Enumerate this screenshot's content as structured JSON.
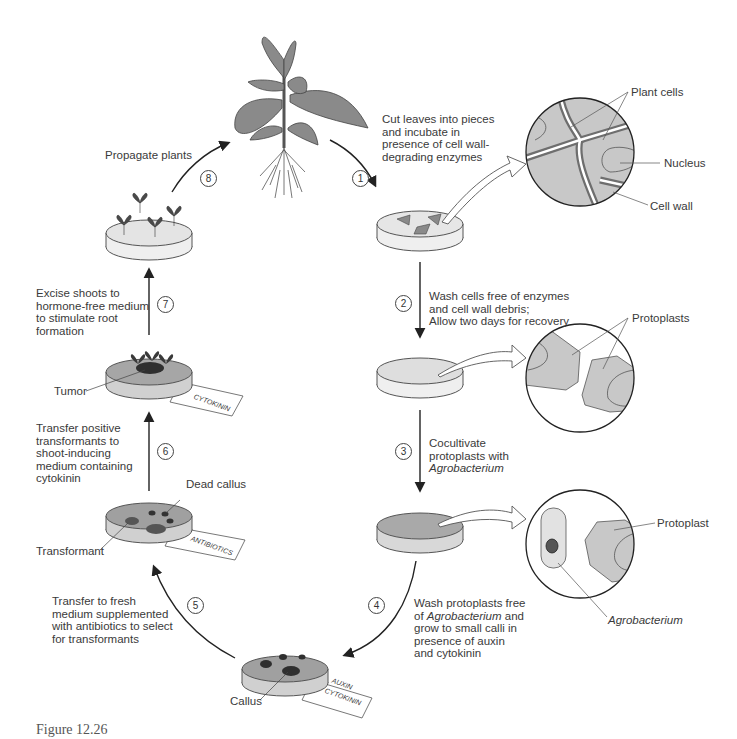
{
  "figure": {
    "caption": "Figure 12.26"
  },
  "steps": [
    {
      "number": "1",
      "text": "Cut leaves into pieces\nand incubate in\npresence of cell wall-\ndegrading enzymes"
    },
    {
      "number": "2",
      "text": "Wash cells free of enzymes\nand cell wall debris;\nAllow two days for recovery"
    },
    {
      "number": "3",
      "line1": "Cocultivate",
      "line2": "protoplasts with",
      "line3_italic": "Agrobacterium"
    },
    {
      "number": "4",
      "line1": "Wash protoplasts free",
      "line2_pre": "of ",
      "line2_italic": "Agrobacterium",
      "line2_post": " and",
      "line3": "grow to small calli in",
      "line4": "presence of auxin",
      "line5": "and cytokinin"
    },
    {
      "number": "5",
      "text": "Transfer to fresh\nmedium supplemented\nwith antibiotics to select\nfor transformants"
    },
    {
      "number": "6",
      "text": "Transfer positive\ntransformants to\nshoot-inducing\nmedium containing\ncytokinin"
    },
    {
      "number": "7",
      "text": "Excise shoots to\nhormone-free medium\nto stimulate root\nformation"
    },
    {
      "number": "8",
      "text": "Propagate plants"
    }
  ],
  "callouts": {
    "plant_cells": "Plant cells",
    "nucleus": "Nucleus",
    "cell_wall": "Cell wall",
    "protoplasts": "Protoplasts",
    "protoplast": "Protoplast",
    "agrobacterium": "Agrobacterium",
    "tumor": "Tumor",
    "dead_callus": "Dead callus",
    "transformant": "Transformant",
    "callus": "Callus"
  },
  "plate_labels": {
    "cytokinin": "CYTOKININ",
    "antibiotics": "ANTIBIOTICS",
    "auxin": "AUXIN",
    "auxin_cytokinin": "CYTOKININ"
  },
  "colors": {
    "leaf": "#8a8a8a",
    "cell_fill": "#c8c8c8",
    "wall": "#6e6e6e",
    "medium_light": "#e4e4e4",
    "medium_dark": "#a9a9a9",
    "callus": "#2f2f2f",
    "line": "#222222"
  }
}
